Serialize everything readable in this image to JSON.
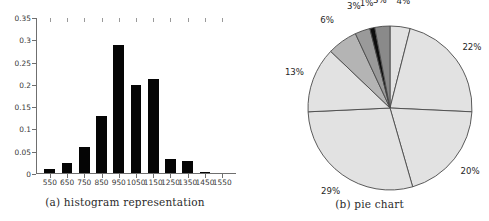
{
  "figure": {
    "subfigures": [
      {
        "id": "a",
        "caption": "(a) histogram representation"
      },
      {
        "id": "b",
        "caption": "(b) pie chart"
      }
    ]
  },
  "chart_data": [
    {
      "type": "bar",
      "title": "(a) histogram representation",
      "xlabel": "",
      "ylabel": "",
      "categories": [
        "550",
        "650",
        "750",
        "850",
        "950",
        "1050",
        "1150",
        "1250",
        "1350",
        "1450",
        "1550"
      ],
      "values": [
        0.009,
        0.023,
        0.058,
        0.127,
        0.288,
        0.197,
        0.211,
        0.032,
        0.027,
        0.003,
        0.0
      ],
      "ylim": [
        0,
        0.35
      ],
      "yticks": [
        0,
        0.05,
        0.1,
        0.15,
        0.2,
        0.25,
        0.3,
        0.35
      ],
      "ytick_labels": [
        "0",
        "0.05",
        "0.1",
        "0.15",
        "0.2",
        "0.25",
        "0.3",
        "0.35"
      ],
      "xtick_labels": [
        "550",
        "650",
        "750",
        "850",
        "950",
        "1050",
        "1150",
        "1250",
        "1350",
        "1450",
        "1550"
      ],
      "grid": false,
      "legend": null,
      "bar_color": "#050505"
    },
    {
      "type": "pie",
      "title": "(b) pie chart",
      "start_angle_deg": 0,
      "direction": "clockwise",
      "slices": [
        {
          "label": "4%",
          "value": 4,
          "color": "#e2e2e2"
        },
        {
          "label": "22%",
          "value": 22,
          "color": "#e2e2e2"
        },
        {
          "label": "20%",
          "value": 20,
          "color": "#e2e2e2"
        },
        {
          "label": "29%",
          "value": 29,
          "color": "#e2e2e2"
        },
        {
          "label": "13%",
          "value": 13,
          "color": "#e2e2e2"
        },
        {
          "label": "6%",
          "value": 6,
          "color": "#b4b4b4"
        },
        {
          "label": "3%",
          "value": 3,
          "color": "#9a9a9a"
        },
        {
          "label": "1%",
          "value": 1,
          "color": "#0d0d0d"
        },
        {
          "label": "3%",
          "value": 3,
          "color": "#8a8a8a"
        }
      ],
      "labels": [
        "6%",
        "3%",
        "1%",
        "3%",
        "4%",
        "22%",
        "20%",
        "29%",
        "13%"
      ],
      "values": [
        6,
        3,
        1,
        3,
        4,
        22,
        20,
        29,
        13
      ],
      "legend": null,
      "edge_color": "#4a4a4a"
    }
  ]
}
